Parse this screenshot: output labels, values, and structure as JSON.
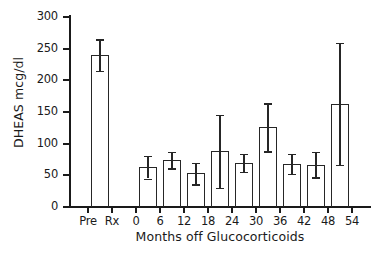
{
  "chart_data": {
    "type": "bar",
    "title": "",
    "xlabel": "Months off Glucocorticoids",
    "ylabel": "DHEAS mcg/dl",
    "ylim": [
      0,
      300
    ],
    "yticks": [
      0,
      50,
      100,
      150,
      200,
      250,
      300
    ],
    "ytick_labels": [
      "0",
      "50",
      "100",
      "150",
      "200",
      "250",
      "300"
    ],
    "xtick_labels": [
      "Pre",
      "Rx",
      "0",
      "6",
      "12",
      "18",
      "24",
      "30",
      "36",
      "42",
      "48",
      "54"
    ],
    "grid": false,
    "legend": "none",
    "error_bars": "symmetric",
    "categories": [
      "Pre Rx",
      "0",
      "6",
      "12",
      "18",
      "24",
      "30",
      "36",
      "42",
      "48"
    ],
    "values": [
      240,
      63,
      74,
      53,
      88,
      70,
      126,
      68,
      67,
      163
    ],
    "errors": [
      25,
      18,
      13,
      17,
      58,
      14,
      38,
      16,
      20,
      96
    ],
    "bars": [
      {
        "label": "Pre Rx",
        "value": 240,
        "error": 25,
        "low": 215,
        "high": 265
      },
      {
        "label": "0",
        "value": 63,
        "error": 18,
        "low": 45,
        "high": 81
      },
      {
        "label": "6",
        "value": 74,
        "error": 13,
        "low": 61,
        "high": 87
      },
      {
        "label": "12",
        "value": 53,
        "error": 17,
        "low": 36,
        "high": 70
      },
      {
        "label": "18",
        "value": 88,
        "error": 58,
        "low": 30,
        "high": 146
      },
      {
        "label": "24",
        "value": 70,
        "error": 14,
        "low": 56,
        "high": 84
      },
      {
        "label": "30",
        "value": 126,
        "error": 38,
        "low": 88,
        "high": 164
      },
      {
        "label": "36",
        "value": 68,
        "error": 16,
        "low": 52,
        "high": 84
      },
      {
        "label": "42",
        "value": 67,
        "error": 20,
        "low": 47,
        "high": 87
      },
      {
        "label": "48",
        "value": 163,
        "error": 96,
        "low": 67,
        "high": 259
      }
    ],
    "colors": {
      "axis": "#1a1a1a",
      "bar_edge": "#262626",
      "bar_fill": "#ffffff",
      "background": "#ffffff"
    }
  }
}
